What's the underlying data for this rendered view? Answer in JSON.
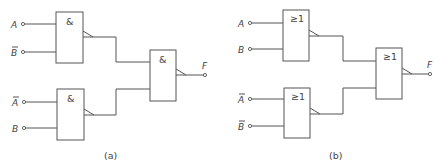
{
  "diagram_a": {
    "caption": "(a)",
    "gate_symbol": "&",
    "inputs": [
      {
        "label": "A",
        "overbar": false
      },
      {
        "label": "B",
        "overbar": true
      },
      {
        "label": "A",
        "overbar": true
      },
      {
        "label": "B",
        "overbar": false
      }
    ],
    "output_label": "F",
    "gates": [
      {
        "id": "g1",
        "symbol": "&",
        "inverted_output": true
      },
      {
        "id": "g2",
        "symbol": "&",
        "inverted_output": true
      },
      {
        "id": "g3",
        "symbol": "&",
        "inverted_output": true
      }
    ]
  },
  "diagram_b": {
    "caption": "(b)",
    "gate_symbol": "≥1",
    "inputs": [
      {
        "label": "A",
        "overbar": false
      },
      {
        "label": "B",
        "overbar": false
      },
      {
        "label": "A",
        "overbar": true
      },
      {
        "label": "B",
        "overbar": true
      }
    ],
    "output_label": "F",
    "gates": [
      {
        "id": "g1",
        "symbol": "≥1",
        "inverted_output": true
      },
      {
        "id": "g2",
        "symbol": "≥1",
        "inverted_output": true
      },
      {
        "id": "g3",
        "symbol": "≥1",
        "inverted_output": true
      }
    ]
  }
}
